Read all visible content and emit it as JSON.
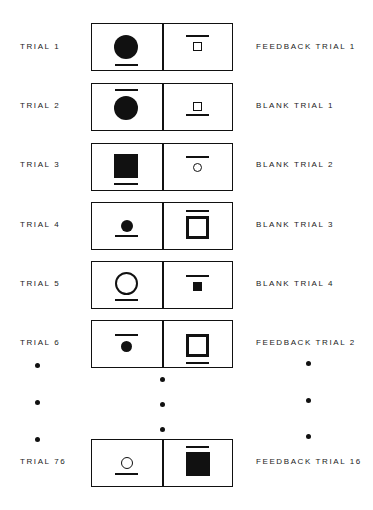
{
  "diagram": {
    "title": "",
    "trials": [
      {
        "left_label": "TRIAL 1",
        "right_label": "FEEDBACK TRIAL 1",
        "left_stimulus": {
          "shape": "circle",
          "size": "large",
          "fill": "filled",
          "mark": "underline"
        },
        "right_stimulus": {
          "shape": "square",
          "size": "small",
          "fill": "outline",
          "mark": "overline"
        }
      },
      {
        "left_label": "TRIAL 2",
        "right_label": "BLANK TRIAL 1",
        "left_stimulus": {
          "shape": "circle",
          "size": "large",
          "fill": "filled",
          "mark": "overline"
        },
        "right_stimulus": {
          "shape": "square",
          "size": "small",
          "fill": "outline",
          "mark": "underline"
        }
      },
      {
        "left_label": "TRIAL 3",
        "right_label": "BLANK TRIAL 2",
        "left_stimulus": {
          "shape": "square",
          "size": "large",
          "fill": "filled",
          "mark": "underline"
        },
        "right_stimulus": {
          "shape": "circle",
          "size": "small",
          "fill": "outline",
          "mark": "overline"
        }
      },
      {
        "left_label": "TRIAL 4",
        "right_label": "BLANK TRIAL 3",
        "left_stimulus": {
          "shape": "circle",
          "size": "small",
          "fill": "filled",
          "mark": "underline"
        },
        "right_stimulus": {
          "shape": "square",
          "size": "large",
          "fill": "outline",
          "mark": "overline"
        }
      },
      {
        "left_label": "TRIAL 5",
        "right_label": "BLANK TRIAL 4",
        "left_stimulus": {
          "shape": "circle",
          "size": "large",
          "fill": "outline",
          "mark": "underline"
        },
        "right_stimulus": {
          "shape": "square",
          "size": "small",
          "fill": "filled",
          "mark": "overline"
        }
      },
      {
        "left_label": "TRIAL 6",
        "right_label": "FEEDBACK TRIAL 2",
        "left_stimulus": {
          "shape": "circle",
          "size": "small",
          "fill": "filled",
          "mark": "overline"
        },
        "right_stimulus": {
          "shape": "square",
          "size": "large",
          "fill": "outline",
          "mark": "underline"
        }
      },
      {
        "left_label": "TRIAL 76",
        "right_label": "FEEDBACK TRIAL 16",
        "left_stimulus": {
          "shape": "circle",
          "size": "small",
          "fill": "outline",
          "mark": "underline"
        },
        "right_stimulus": {
          "shape": "square",
          "size": "large",
          "fill": "filled",
          "mark": "overline"
        }
      }
    ],
    "ellipsis": {
      "left_dots": 3,
      "center_dots": 3,
      "right_dots": 3
    },
    "colors": {
      "ink": "#111111",
      "background": "#ffffff"
    }
  }
}
